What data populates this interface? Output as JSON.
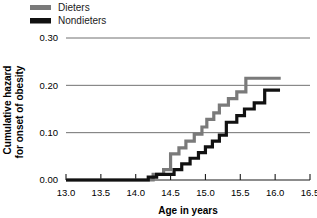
{
  "chart_data": {
    "type": "line",
    "subtype": "step",
    "title": "",
    "xlabel": "Age in years",
    "ylabel": "Cumulative hazard for onset of obesity",
    "ylabel_lines": [
      "Cumulative hazard",
      "for onset of obesity"
    ],
    "xlim": [
      13.0,
      16.5
    ],
    "ylim": [
      0.0,
      0.3
    ],
    "xticks": [
      13.0,
      13.5,
      14.0,
      14.5,
      15.0,
      15.5,
      16.0,
      16.5
    ],
    "xtick_labels": [
      "13.0",
      "13.5",
      "14.0",
      "14.5",
      "15.0",
      "15.5",
      "16.0",
      "16.5"
    ],
    "yticks": [
      0.0,
      0.1,
      0.2,
      0.3
    ],
    "ytick_labels": [
      "0.00",
      "0.10",
      "0.20",
      "0.30"
    ],
    "grid": "horizontal",
    "legend_position": "top-left-outside",
    "series": [
      {
        "name": "Dieters",
        "color": "#7a7a7a",
        "linewidth": 3.2,
        "points": [
          [
            13.0,
            0.0
          ],
          [
            14.25,
            0.0
          ],
          [
            14.25,
            0.012
          ],
          [
            14.4,
            0.012
          ],
          [
            14.4,
            0.022
          ],
          [
            14.5,
            0.022
          ],
          [
            14.5,
            0.055
          ],
          [
            14.62,
            0.055
          ],
          [
            14.62,
            0.068
          ],
          [
            14.72,
            0.068
          ],
          [
            14.72,
            0.082
          ],
          [
            14.84,
            0.082
          ],
          [
            14.84,
            0.097
          ],
          [
            14.95,
            0.097
          ],
          [
            14.95,
            0.112
          ],
          [
            15.02,
            0.112
          ],
          [
            15.02,
            0.128
          ],
          [
            15.12,
            0.128
          ],
          [
            15.12,
            0.142
          ],
          [
            15.2,
            0.142
          ],
          [
            15.2,
            0.158
          ],
          [
            15.33,
            0.158
          ],
          [
            15.33,
            0.172
          ],
          [
            15.45,
            0.172
          ],
          [
            15.45,
            0.186
          ],
          [
            15.58,
            0.186
          ],
          [
            15.58,
            0.215
          ],
          [
            16.08,
            0.215
          ]
        ]
      },
      {
        "name": "Nondieters",
        "color": "#111111",
        "linewidth": 3.2,
        "points": [
          [
            13.0,
            0.0
          ],
          [
            14.18,
            0.0
          ],
          [
            14.18,
            0.006
          ],
          [
            14.3,
            0.006
          ],
          [
            14.3,
            0.012
          ],
          [
            14.55,
            0.012
          ],
          [
            14.55,
            0.022
          ],
          [
            14.66,
            0.022
          ],
          [
            14.66,
            0.034
          ],
          [
            14.78,
            0.034
          ],
          [
            14.78,
            0.046
          ],
          [
            14.9,
            0.046
          ],
          [
            14.9,
            0.058
          ],
          [
            15.0,
            0.058
          ],
          [
            15.0,
            0.07
          ],
          [
            15.1,
            0.07
          ],
          [
            15.1,
            0.082
          ],
          [
            15.2,
            0.082
          ],
          [
            15.2,
            0.095
          ],
          [
            15.3,
            0.095
          ],
          [
            15.3,
            0.122
          ],
          [
            15.45,
            0.122
          ],
          [
            15.45,
            0.136
          ],
          [
            15.56,
            0.136
          ],
          [
            15.56,
            0.15
          ],
          [
            15.7,
            0.15
          ],
          [
            15.7,
            0.163
          ],
          [
            15.85,
            0.163
          ],
          [
            15.85,
            0.19
          ],
          [
            16.07,
            0.19
          ]
        ]
      }
    ]
  },
  "legend": {
    "items": [
      {
        "label": "Dieters",
        "color": "#7a7a7a"
      },
      {
        "label": "Nondieters",
        "color": "#111111"
      }
    ]
  },
  "axes": {
    "x_title": "Age in years",
    "y_title_line1": "Cumulative hazard",
    "y_title_line2": "for onset of obesity"
  }
}
